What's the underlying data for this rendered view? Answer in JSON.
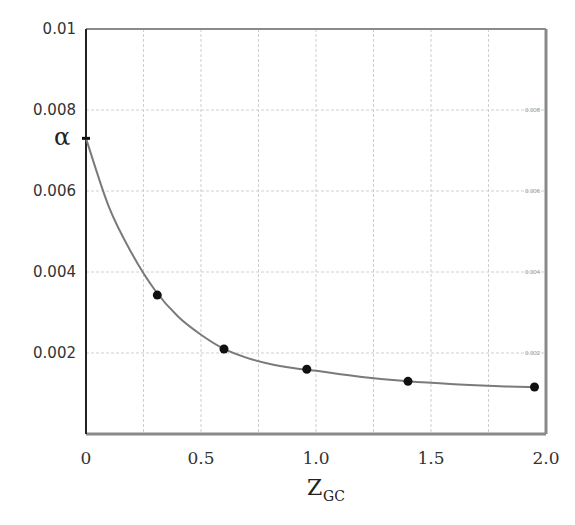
{
  "chart_data": {
    "type": "line",
    "title": "",
    "xlabel": "Z",
    "xlabel_subscript": "GC",
    "ylabel": "",
    "xlim": [
      0,
      2.0
    ],
    "ylim": [
      0,
      0.01
    ],
    "grid": true,
    "x_ticks": [
      {
        "value": 0,
        "label": "0"
      },
      {
        "value": 0.5,
        "label": "0.5"
      },
      {
        "value": 1.0,
        "label": "1.0"
      },
      {
        "value": 1.5,
        "label": "1.5"
      },
      {
        "value": 2.0,
        "label": "2.0"
      }
    ],
    "y_ticks_left": [
      {
        "value": 0.01,
        "label": "0.01"
      },
      {
        "value": 0.008,
        "label": "0.008"
      },
      {
        "value": 0.006,
        "label": "0.006"
      },
      {
        "value": 0.004,
        "label": "0.004"
      },
      {
        "value": 0.002,
        "label": "0.002"
      }
    ],
    "y_ticks_right": [
      {
        "value": 0.008,
        "label": "0.008"
      },
      {
        "value": 0.006,
        "label": "0.006"
      },
      {
        "value": 0.004,
        "label": "0.004"
      },
      {
        "value": 0.002,
        "label": "0.002"
      }
    ],
    "annotations": [
      {
        "text": "α",
        "x": 0,
        "y": 0.0073,
        "note": "intercept marker on y-axis"
      }
    ],
    "series": [
      {
        "name": "fitted curve",
        "style": "line",
        "color": "#7a7a7a",
        "x": [
          0,
          0.1,
          0.2,
          0.3,
          0.4,
          0.5,
          0.6,
          0.7,
          0.8,
          0.9,
          1.0,
          1.2,
          1.4,
          1.6,
          1.8,
          1.95
        ],
        "values": [
          0.0073,
          0.0056,
          0.00445,
          0.00355,
          0.0029,
          0.00245,
          0.0021,
          0.00188,
          0.00173,
          0.00163,
          0.00156,
          0.00141,
          0.0013,
          0.00123,
          0.00118,
          0.00116
        ]
      },
      {
        "name": "data points",
        "style": "scatter",
        "color": "#111111",
        "x": [
          0.31,
          0.6,
          0.96,
          1.4,
          1.95
        ],
        "values": [
          0.00343,
          0.0021,
          0.0016,
          0.0013,
          0.00116
        ]
      }
    ]
  }
}
